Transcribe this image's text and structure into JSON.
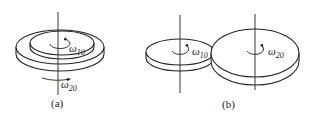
{
  "figure": {
    "panel_a": {
      "caption": "(a)",
      "omega_inner": "ω",
      "omega_inner_sub": "10",
      "omega_outer": "ω",
      "omega_outer_sub": "20"
    },
    "panel_b": {
      "caption": "(b)",
      "omega_small": "ω",
      "omega_small_sub": "10",
      "omega_large": "ω",
      "omega_large_sub": "20"
    },
    "colors": {
      "stroke": "#222222",
      "background": "#ffffff"
    }
  }
}
